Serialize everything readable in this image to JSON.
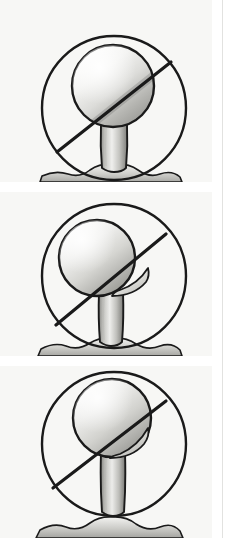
{
  "figure": {
    "background_color": "#f7f7f5",
    "page_color": "#ffffff",
    "ink_color": "#1a1a1a",
    "divider_color": "#e2e2e0",
    "panel_count": 3,
    "caption": ""
  },
  "panels": [
    {
      "id": "panel-1",
      "label": "Tee height position 1 — ball centered, line crosses lower ball",
      "circle": {
        "cx": 114,
        "cy": 108,
        "r": 72,
        "stroke": "#1a1a1a",
        "stroke_width": 2.4
      },
      "ball": {
        "cx": 113,
        "cy": 86,
        "rx": 41,
        "ry": 41,
        "stroke": "#1a1a1a",
        "stroke_width": 2.4
      },
      "tee": {
        "top_y": 124,
        "bottom_y": 172,
        "top_width": 26,
        "bottom_width": 22,
        "cx": 114
      },
      "slash": {
        "x1": 57,
        "y1": 152,
        "x2": 171,
        "y2": 62,
        "stroke": "#1a1a1a",
        "stroke_width": 3.2
      },
      "ground": {
        "y": 168,
        "label": "turf mound"
      },
      "annotation": ""
    },
    {
      "id": "panel-2",
      "label": "Tee height position 2 — ball shifted left, line crosses ball equator",
      "circle": {
        "cx": 114,
        "cy": 84,
        "r": 72,
        "stroke": "#1a1a1a",
        "stroke_width": 2.4
      },
      "ball": {
        "cx": 97,
        "cy": 66,
        "rx": 38,
        "ry": 38,
        "stroke": "#1a1a1a",
        "stroke_width": 2.4
      },
      "tee": {
        "top_y": 100,
        "bottom_y": 152,
        "top_width": 24,
        "bottom_width": 20,
        "cx": 110
      },
      "slash": {
        "x1": 56,
        "y1": 133,
        "x2": 166,
        "y2": 42,
        "stroke": "#1a1a1a",
        "stroke_width": 3.2
      },
      "ground": {
        "y": 148,
        "label": "turf mound"
      },
      "annotation": ""
    },
    {
      "id": "panel-3",
      "label": "Tee height position 3 — ball raised and right, line crosses ball low",
      "circle": {
        "cx": 114,
        "cy": 78,
        "r": 72,
        "stroke": "#1a1a1a",
        "stroke_width": 2.4
      },
      "ball": {
        "cx": 112,
        "cy": 52,
        "rx": 39,
        "ry": 39,
        "stroke": "#1a1a1a",
        "stroke_width": 2.4
      },
      "tee": {
        "top_y": 86,
        "bottom_y": 146,
        "top_width": 22,
        "bottom_width": 20,
        "cx": 112
      },
      "slash": {
        "x1": 53,
        "y1": 122,
        "x2": 166,
        "y2": 35,
        "stroke": "#1a1a1a",
        "stroke_width": 3.2
      },
      "ground": {
        "y": 142,
        "label": "turf mound"
      },
      "annotation": ""
    }
  ],
  "legend": {
    "visible": false,
    "entries": []
  },
  "text_labels": []
}
